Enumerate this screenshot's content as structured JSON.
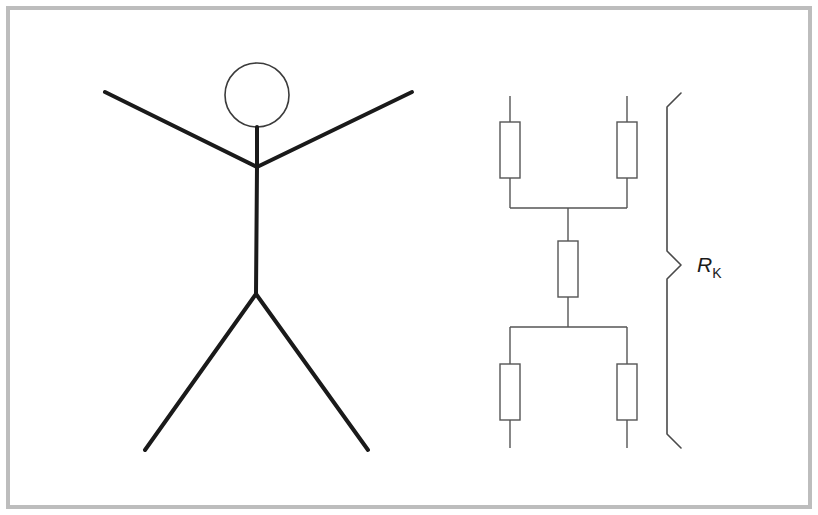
{
  "figure": {
    "background_color": "#ffffff",
    "frame": {
      "color": "#bdbdbd",
      "stroke_width": 4,
      "x": 8,
      "y": 8,
      "width": 802,
      "height": 499
    },
    "stroke_colors": {
      "figure_stroke": "#1a1a1a",
      "head_stroke": "#3b3b3b",
      "circuit_stroke": "#555555",
      "brace_stroke": "#4a4a4a"
    }
  },
  "stick_figure": {
    "name": "stick-figure",
    "head": {
      "cx": 257,
      "cy": 95,
      "r": 32,
      "stroke_width": 1.6
    },
    "neck": {
      "x1": 257,
      "y1": 127,
      "x2": 257,
      "y2": 167,
      "stroke_width": 4
    },
    "torso": {
      "x1": 257,
      "y1": 167,
      "x2": 256,
      "y2": 294,
      "stroke_width": 4
    },
    "arm_left": {
      "x1": 257,
      "y1": 167,
      "x2": 105,
      "y2": 92,
      "stroke_width": 4
    },
    "arm_right": {
      "x1": 257,
      "y1": 167,
      "x2": 412,
      "y2": 92,
      "stroke_width": 4
    },
    "leg_left": {
      "x1": 256,
      "y1": 294,
      "x2": 145,
      "y2": 450,
      "stroke_width": 4
    },
    "leg_right": {
      "x1": 256,
      "y1": 294,
      "x2": 368,
      "y2": 450,
      "stroke_width": 4
    }
  },
  "circuit": {
    "name": "resistor-network",
    "label": {
      "symbol": "R",
      "subscript": "K",
      "x": 697,
      "y": 272
    },
    "geometry": {
      "left_x": 510,
      "right_x": 627,
      "center_x": 568,
      "top_stub_y": 96,
      "bottom_stub_y": 448,
      "top_bus_y": 208,
      "bottom_bus_y": 327,
      "resistor_width": 20,
      "resistor_height": 56,
      "stroke_width": 1.4
    },
    "resistors": [
      {
        "id": "r-top-left",
        "cx": 510,
        "cy": 150
      },
      {
        "id": "r-top-right",
        "cx": 627,
        "cy": 150
      },
      {
        "id": "r-middle",
        "cx": 568,
        "cy": 269
      },
      {
        "id": "r-bottom-left",
        "cx": 510,
        "cy": 392
      },
      {
        "id": "r-bottom-right",
        "cx": 627,
        "cy": 392
      }
    ],
    "brace": {
      "x": 667,
      "tip_x": 681,
      "top_y": 93,
      "bottom_y": 448,
      "mid_y": 265,
      "stroke_width": 1.6
    }
  },
  "watermark": {
    "text": "",
    "x": 170,
    "y": 480
  }
}
